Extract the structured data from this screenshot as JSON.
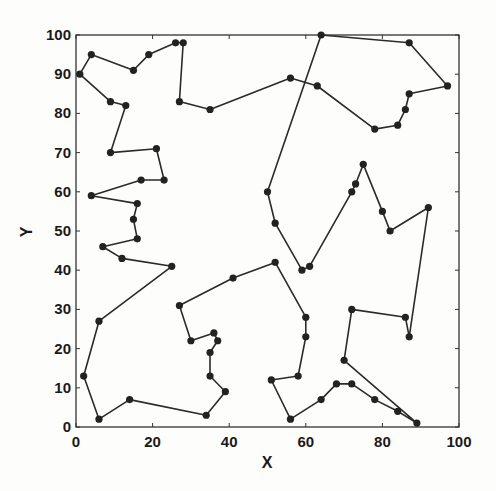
{
  "chart_data": {
    "type": "line",
    "subtype": "closed-tour-with-markers",
    "title": "",
    "xlabel": "X",
    "ylabel": "Y",
    "xlim": [
      0,
      100
    ],
    "ylim": [
      0,
      100
    ],
    "xticks": [
      0,
      20,
      40,
      60,
      80,
      100
    ],
    "yticks": [
      0,
      10,
      20,
      30,
      40,
      50,
      60,
      70,
      80,
      90,
      100
    ],
    "grid": false,
    "legend": null,
    "colors": {
      "line": "#2a2a2a",
      "marker": "#222222",
      "axis": "#333333"
    },
    "series": [
      {
        "name": "tour",
        "closed": true,
        "points": [
          [
            1,
            90
          ],
          [
            4,
            95
          ],
          [
            15,
            91
          ],
          [
            19,
            95
          ],
          [
            26,
            98
          ],
          [
            28,
            98
          ],
          [
            27,
            83
          ],
          [
            35,
            81
          ],
          [
            56,
            89
          ],
          [
            63,
            87
          ],
          [
            78,
            76
          ],
          [
            84,
            77
          ],
          [
            86,
            81
          ],
          [
            87,
            85
          ],
          [
            97,
            87
          ],
          [
            87,
            98
          ],
          [
            64,
            100
          ],
          [
            50,
            60
          ],
          [
            52,
            52
          ],
          [
            59,
            40
          ],
          [
            61,
            41
          ],
          [
            72,
            60
          ],
          [
            73,
            62
          ],
          [
            75,
            67
          ],
          [
            80,
            55
          ],
          [
            82,
            50
          ],
          [
            92,
            56
          ],
          [
            87,
            23
          ],
          [
            86,
            28
          ],
          [
            72,
            30
          ],
          [
            70,
            17
          ],
          [
            89,
            1
          ],
          [
            84,
            4
          ],
          [
            78,
            7
          ],
          [
            72,
            11
          ],
          [
            68,
            11
          ],
          [
            64,
            7
          ],
          [
            56,
            2
          ],
          [
            51,
            12
          ],
          [
            58,
            13
          ],
          [
            60,
            23
          ],
          [
            60,
            28
          ],
          [
            52,
            42
          ],
          [
            41,
            38
          ],
          [
            27,
            31
          ],
          [
            30,
            22
          ],
          [
            36,
            24
          ],
          [
            37,
            22
          ],
          [
            35,
            19
          ],
          [
            35,
            13
          ],
          [
            39,
            9
          ],
          [
            34,
            3
          ],
          [
            14,
            7
          ],
          [
            6,
            2
          ],
          [
            2,
            13
          ],
          [
            6,
            27
          ],
          [
            25,
            41
          ],
          [
            12,
            43
          ],
          [
            7,
            46
          ],
          [
            16,
            48
          ],
          [
            15,
            53
          ],
          [
            16,
            57
          ],
          [
            4,
            59
          ],
          [
            17,
            63
          ],
          [
            23,
            63
          ],
          [
            21,
            71
          ],
          [
            9,
            70
          ],
          [
            13,
            82
          ],
          [
            9,
            83
          ]
        ]
      }
    ]
  },
  "axes": {
    "x_label": "X",
    "y_label": "Y",
    "x_tick_labels": [
      "0",
      "20",
      "40",
      "60",
      "80",
      "100"
    ],
    "y_tick_labels": [
      "0",
      "10",
      "20",
      "30",
      "40",
      "50",
      "60",
      "70",
      "80",
      "90",
      "100"
    ]
  }
}
